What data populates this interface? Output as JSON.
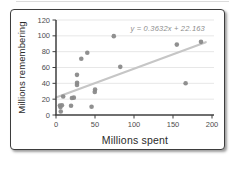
{
  "chart_data": {
    "type": "scatter",
    "xlabel": "Millions spent",
    "ylabel": "Millions remembering",
    "xlim": [
      0,
      200
    ],
    "ylim": [
      0,
      120
    ],
    "x_ticks": [
      0,
      50,
      100,
      150,
      200
    ],
    "y_ticks": [
      0,
      20,
      40,
      60,
      80,
      100,
      120
    ],
    "grid": "horizontal",
    "legend": "none",
    "points": [
      [
        50.1,
        32.1
      ],
      [
        74.1,
        99.6
      ],
      [
        19.3,
        11.7
      ],
      [
        22.9,
        21.9
      ],
      [
        82.4,
        60.8
      ],
      [
        40.1,
        78.6
      ],
      [
        185.9,
        92.4
      ],
      [
        26.9,
        50.7
      ],
      [
        20.4,
        21.4
      ],
      [
        166.2,
        40.1
      ],
      [
        27.0,
        40.8
      ],
      [
        45.6,
        10.4
      ],
      [
        154.9,
        88.9
      ],
      [
        5.0,
        12.0
      ],
      [
        49.7,
        29.2
      ],
      [
        26.9,
        38.0
      ],
      [
        5.7,
        10.0
      ],
      [
        7.6,
        12.3
      ],
      [
        9.2,
        23.4
      ],
      [
        32.4,
        71.1
      ],
      [
        6.1,
        4.4
      ]
    ],
    "trendline": {
      "slope": 0.3632,
      "intercept": 22.163,
      "label": "y = 0.3632x + 22.163",
      "x_start": 0,
      "x_end": 192
    },
    "colors": {
      "marker": "#8a8a8a",
      "trendline": "#c6c6c6",
      "axis": "#3f3f3f",
      "grid": "#e7e7e7",
      "tick_text": "#4d4d4d",
      "equation_text": "#8c8c8c",
      "axis_title_text": "#2b2b2b",
      "card_border": "#3d3d3d"
    }
  }
}
